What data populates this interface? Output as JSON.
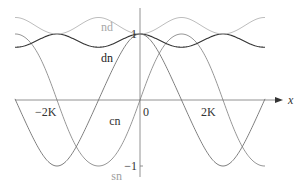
{
  "chart_data": {
    "type": "line",
    "title": "",
    "xlabel": "x",
    "ylabel": "",
    "xlim": [
      -3.6,
      3.0
    ],
    "ylim": [
      -1.1,
      1.3
    ],
    "grid": false,
    "x_unit": "K",
    "xticks": [
      {
        "value": -2,
        "label": "−2K"
      },
      {
        "value": 0,
        "label": "0"
      },
      {
        "value": 2,
        "label": "2K"
      }
    ],
    "yticks": [
      {
        "value": 1,
        "label": "1"
      },
      {
        "value": -1,
        "label": "−1"
      }
    ],
    "modulus_k": 0.6,
    "series": [
      {
        "name": "sn",
        "color": "#8a8a8a",
        "label_pos": {
          "x": -0.5,
          "y": -1.15
        },
        "label_color": "#a0a0a0"
      },
      {
        "name": "cn",
        "color": "#707070",
        "label_pos": {
          "x": -0.55,
          "y": -0.32
        },
        "label_color": "#333333"
      },
      {
        "name": "dn",
        "color": "#333333",
        "label_pos": {
          "x": -0.75,
          "y": 0.64
        },
        "label_color": "#222222"
      },
      {
        "name": "nd",
        "color": "#b5b5b5",
        "label_pos": {
          "x": -0.75,
          "y": 1.1
        },
        "label_color": "#a8a8a8"
      }
    ]
  }
}
